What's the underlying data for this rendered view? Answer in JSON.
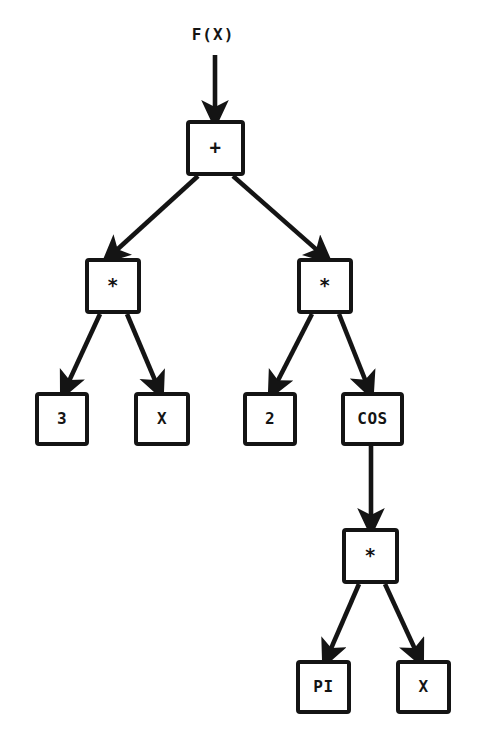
{
  "diagram": {
    "title": "F(X)",
    "type": "expression-tree",
    "expression": "F(X) = 3 * X + 2 * COS(PI * X)",
    "colors": {
      "ink": "#141414",
      "background": "#ffffff"
    },
    "input_label": {
      "text": "F(X)",
      "x": 213,
      "y": 25
    },
    "nodes": [
      {
        "id": "root",
        "label": "+",
        "kind": "operator",
        "x": 186,
        "y": 120,
        "w": 59,
        "h": 56
      },
      {
        "id": "mul-left",
        "label": "*",
        "kind": "operator",
        "x": 85,
        "y": 258,
        "w": 56,
        "h": 56
      },
      {
        "id": "mul-right",
        "label": "*",
        "kind": "operator",
        "x": 297,
        "y": 258,
        "w": 56,
        "h": 56
      },
      {
        "id": "const-3",
        "label": "3",
        "kind": "constant",
        "x": 35,
        "y": 392,
        "w": 54,
        "h": 54
      },
      {
        "id": "var-x-left",
        "label": "X",
        "kind": "variable",
        "x": 134,
        "y": 392,
        "w": 56,
        "h": 54
      },
      {
        "id": "const-2",
        "label": "2",
        "kind": "constant",
        "x": 243,
        "y": 392,
        "w": 54,
        "h": 54
      },
      {
        "id": "func-cos",
        "label": "COS",
        "kind": "function",
        "x": 341,
        "y": 392,
        "w": 63,
        "h": 54
      },
      {
        "id": "mul-bottom",
        "label": "*",
        "kind": "operator",
        "x": 342,
        "y": 528,
        "w": 57,
        "h": 56
      },
      {
        "id": "const-pi",
        "label": "PI",
        "kind": "constant",
        "x": 296,
        "y": 660,
        "w": 55,
        "h": 54
      },
      {
        "id": "var-x-bottom",
        "label": "X",
        "kind": "variable",
        "x": 396,
        "y": 660,
        "w": 55,
        "h": 54
      }
    ],
    "edges": [
      {
        "id": "input-to-root",
        "from": "input",
        "to": "root",
        "x1": 215,
        "y1": 55,
        "x2": 215,
        "y2": 120
      },
      {
        "id": "root-to-mul-left",
        "from": "root",
        "to": "mul-left",
        "x1": 198,
        "y1": 176,
        "x2": 108,
        "y2": 258
      },
      {
        "id": "root-to-mul-right",
        "from": "root",
        "to": "mul-right",
        "x1": 233,
        "y1": 176,
        "x2": 326,
        "y2": 258
      },
      {
        "id": "mul-left-to-const-3",
        "from": "mul-left",
        "to": "const-3",
        "x1": 100,
        "y1": 314,
        "x2": 64,
        "y2": 392
      },
      {
        "id": "mul-left-to-var-x",
        "from": "mul-left",
        "to": "var-x-left",
        "x1": 127,
        "y1": 314,
        "x2": 160,
        "y2": 392
      },
      {
        "id": "mul-right-to-const-2",
        "from": "mul-right",
        "to": "const-2",
        "x1": 312,
        "y1": 314,
        "x2": 272,
        "y2": 392
      },
      {
        "id": "mul-right-to-cos",
        "from": "mul-right",
        "to": "func-cos",
        "x1": 339,
        "y1": 314,
        "x2": 370,
        "y2": 392
      },
      {
        "id": "cos-to-mul-bottom",
        "from": "func-cos",
        "to": "mul-bottom",
        "x1": 371,
        "y1": 446,
        "x2": 371,
        "y2": 528
      },
      {
        "id": "mul-bottom-to-pi",
        "from": "mul-bottom",
        "to": "const-pi",
        "x1": 359,
        "y1": 584,
        "x2": 326,
        "y2": 660
      },
      {
        "id": "mul-bottom-to-var-x",
        "from": "mul-bottom",
        "to": "var-x-bottom",
        "x1": 385,
        "y1": 584,
        "x2": 420,
        "y2": 660
      }
    ]
  }
}
